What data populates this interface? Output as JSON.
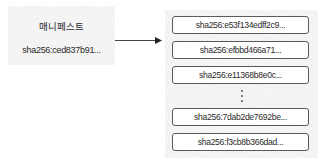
{
  "manifest": {
    "title": "매니페스트",
    "digest": "sha256:ced837b91..."
  },
  "arrow": {
    "direction": "right",
    "color": "#333333"
  },
  "layers": {
    "items": [
      {
        "digest": "sha256:e53f134edff2c9..."
      },
      {
        "digest": "sha256:efbbd466a71..."
      },
      {
        "digest": "sha256:e11368b8e0c..."
      },
      {
        "digest": "sha256:7dab2de7692be..."
      },
      {
        "digest": "sha256:f3cb8b366dad..."
      }
    ],
    "ellipsis": "⋮"
  },
  "colors": {
    "box_fill": "#f1f1f1",
    "layer_border": "#5a5a5a",
    "text": "#2a2a2a"
  }
}
